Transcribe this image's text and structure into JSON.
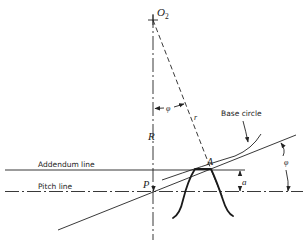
{
  "figure": {
    "type": "gear tooth geometry diagram",
    "labels": {
      "center": "O",
      "center_subscript": "2",
      "radius_R": "R",
      "radius_r": "r",
      "pitch_point": "P",
      "contact_point": "A",
      "angle_phi_top": "φ",
      "angle_phi_right": "φ",
      "addendum_dim": "a",
      "base_circle": "Base circle",
      "addendum_line": "Addendum line",
      "pitch_line": "Pitch line"
    }
  }
}
